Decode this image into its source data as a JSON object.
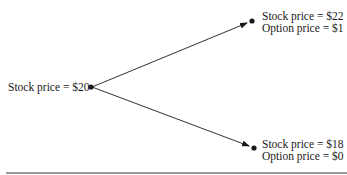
{
  "diagram": {
    "type": "binomial-tree",
    "root": {
      "label": "Stock price = $20"
    },
    "up_node": {
      "stock_label": "Stock price = $22",
      "option_label": "Option price = $1"
    },
    "down_node": {
      "stock_label": "Stock price = $18",
      "option_label": "Option price = $0"
    },
    "colors": {
      "line": "#1a1a1a",
      "rule": "#9a9a9a",
      "background": "#ffffff"
    }
  }
}
